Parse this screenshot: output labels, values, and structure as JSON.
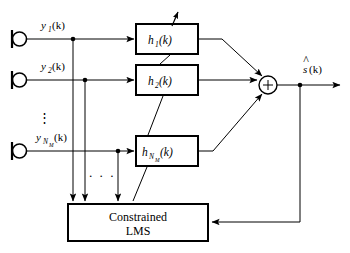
{
  "diagram": {
    "colors": {
      "stroke": "#000000",
      "background": "#ffffff",
      "text": "#000000"
    },
    "microphones": [
      {
        "name": "mic-1",
        "signal_base": "y",
        "signal_sub": "1",
        "signal_arg": "(k)"
      },
      {
        "name": "mic-2",
        "signal_base": "y",
        "signal_sub": "2",
        "signal_arg": "(k)"
      },
      {
        "name": "mic-nm",
        "signal_base": "y",
        "signal_sub": "N",
        "signal_sub2": "M",
        "signal_arg": "(k)"
      }
    ],
    "filters": [
      {
        "name": "filter-1",
        "base": "h",
        "sub": "1",
        "arg": "(k)"
      },
      {
        "name": "filter-2",
        "base": "h",
        "sub": "2",
        "arg": "(k)"
      },
      {
        "name": "filter-nm",
        "base": "h",
        "sub": "N",
        "sub2": "M",
        "arg": "(k)"
      }
    ],
    "summer": {
      "symbol": "+"
    },
    "output": {
      "base": "s",
      "hat": "^",
      "arg": "(k)"
    },
    "adaptive_block": {
      "line1": "Constrained",
      "line2": "LMS"
    },
    "ellipsis": {
      "vertical": "⋮",
      "horizontal": "· · ·"
    }
  }
}
